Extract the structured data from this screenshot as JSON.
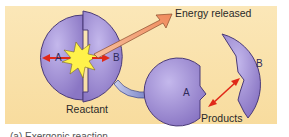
{
  "diagram": {
    "labels": {
      "energy": "Energy released",
      "reactant": "Reactant",
      "products": "Products",
      "reactant_a": "A",
      "reactant_b": "B",
      "product_a": "A",
      "product_b": "B"
    },
    "caption": "(a) Exergonic reaction",
    "colors": {
      "panel_bg": "#f8dc9e",
      "molecule_fill": "#a898d8",
      "molecule_stroke": "#4a3a78",
      "burst_fill": "#fff24a",
      "energy_arrow": "#f4a07a",
      "red_arrow": "#e02818",
      "blue_arrow": "#7a86c8"
    }
  }
}
